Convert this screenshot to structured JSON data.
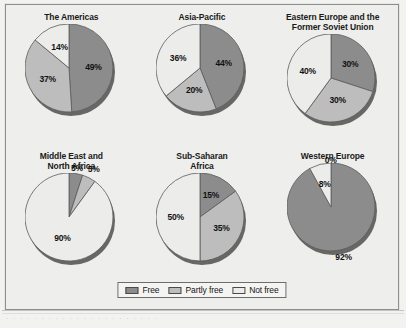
{
  "figure": {
    "background_color": "#eeeeec",
    "frame_color": "#8e8e8e"
  },
  "legend": {
    "entries": [
      {
        "label": "Free",
        "color": "#8c8c8c"
      },
      {
        "label": "Partly free",
        "color": "#bdbdbd"
      },
      {
        "label": "Not free",
        "color": "#ececeb"
      }
    ]
  },
  "caption": {
    "text": "·   ·   ·    ·   ·   ·    ·    ·   ·   ·    ·   ·    ·   ·   ·    ·    ·   ·   ·    ·   ·   ·"
  },
  "chart_data": [
    {
      "type": "pie",
      "title": "The Americas",
      "categories": [
        "Free",
        "Partly free",
        "Not free"
      ],
      "values": [
        49,
        37,
        14
      ],
      "labels": [
        "49%",
        "37%",
        "14%"
      ],
      "colors": [
        "#8c8c8c",
        "#bdbdbd",
        "#ececeb"
      ],
      "start_angle": 0,
      "legend_position": "figure-bottom-center"
    },
    {
      "type": "pie",
      "title": "Asia-Pacific",
      "categories": [
        "Free",
        "Partly free",
        "Not free"
      ],
      "values": [
        44,
        20,
        36
      ],
      "labels": [
        "44%",
        "20%",
        "36%"
      ],
      "colors": [
        "#8c8c8c",
        "#bdbdbd",
        "#ececeb"
      ],
      "start_angle": 0,
      "legend_position": "figure-bottom-center"
    },
    {
      "type": "pie",
      "title": "Eastern Europe and the\nFormer Soviet Union",
      "categories": [
        "Free",
        "Partly free",
        "Not free"
      ],
      "values": [
        30,
        30,
        40
      ],
      "labels": [
        "30%",
        "30%",
        "40%"
      ],
      "colors": [
        "#8c8c8c",
        "#bdbdbd",
        "#ececeb"
      ],
      "start_angle": 0,
      "legend_position": "figure-bottom-center"
    },
    {
      "type": "pie",
      "title": "Middle East and\nNorth Africa",
      "categories": [
        "Free",
        "Partly free",
        "Not free"
      ],
      "values": [
        5,
        5,
        90
      ],
      "labels": [
        "5%",
        "5%",
        "90%"
      ],
      "colors": [
        "#8c8c8c",
        "#bdbdbd",
        "#ececeb"
      ],
      "start_angle": 0,
      "legend_position": "figure-bottom-center"
    },
    {
      "type": "pie",
      "title": "Sub-Saharan\nAfrica",
      "categories": [
        "Free",
        "Partly free",
        "Not free"
      ],
      "values": [
        15,
        35,
        50
      ],
      "labels": [
        "15%",
        "35%",
        "50%"
      ],
      "colors": [
        "#8c8c8c",
        "#bdbdbd",
        "#ececeb"
      ],
      "start_angle": 0,
      "legend_position": "figure-bottom-center"
    },
    {
      "type": "pie",
      "title": "Western Europe",
      "categories": [
        "Free",
        "Partly free",
        "Not free"
      ],
      "values": [
        92,
        0,
        8
      ],
      "labels": [
        "92%",
        "0%",
        "8%"
      ],
      "colors": [
        "#8c8c8c",
        "#bdbdbd",
        "#ececeb"
      ],
      "start_angle": 0,
      "legend_position": "figure-bottom-center"
    }
  ]
}
